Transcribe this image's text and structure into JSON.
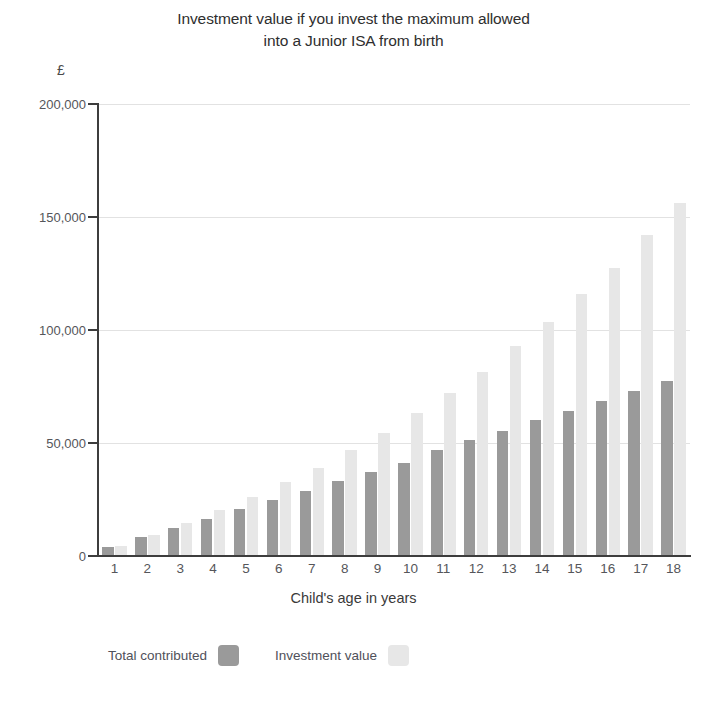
{
  "chart_data": {
    "type": "bar",
    "title": "Investment value if you invest the maximum allowed into a Junior ISA from birth",
    "title_line1": "Investment value if you invest the maximum allowed",
    "title_line2": "into a Junior ISA from birth",
    "xlabel": "Child's age in years",
    "ylabel": "",
    "y_unit": "£",
    "ylim": [
      0,
      200000
    ],
    "grid": true,
    "legend_position": "bottom-left",
    "categories": [
      "1",
      "2",
      "3",
      "4",
      "5",
      "6",
      "7",
      "8",
      "9",
      "10",
      "11",
      "12",
      "13",
      "14",
      "15",
      "16",
      "17",
      "18"
    ],
    "ytick_labels": [
      "200,000",
      "150,000",
      "100,000",
      "50,000",
      "0"
    ],
    "ytick_values": [
      200000,
      150000,
      100000,
      50000,
      0
    ],
    "series": [
      {
        "name": "Total contributed",
        "color": "#9a9a9a",
        "values": [
          4128,
          8256,
          12384,
          16512,
          20640,
          24768,
          28896,
          33024,
          37152,
          41280,
          47000,
          51500,
          55500,
          60000,
          64000,
          68500,
          73000,
          77500
        ]
      },
      {
        "name": "Investment value",
        "color": "#e7e7e7",
        "values": [
          4400,
          9300,
          14500,
          20200,
          26300,
          32800,
          39000,
          46800,
          54500,
          63500,
          72000,
          81500,
          93000,
          103500,
          116000,
          127500,
          142000,
          156000
        ]
      }
    ]
  },
  "legend": {
    "items": [
      {
        "label": "Total contributed",
        "swatch": "contributed"
      },
      {
        "label": "Investment value",
        "swatch": "value"
      }
    ]
  }
}
